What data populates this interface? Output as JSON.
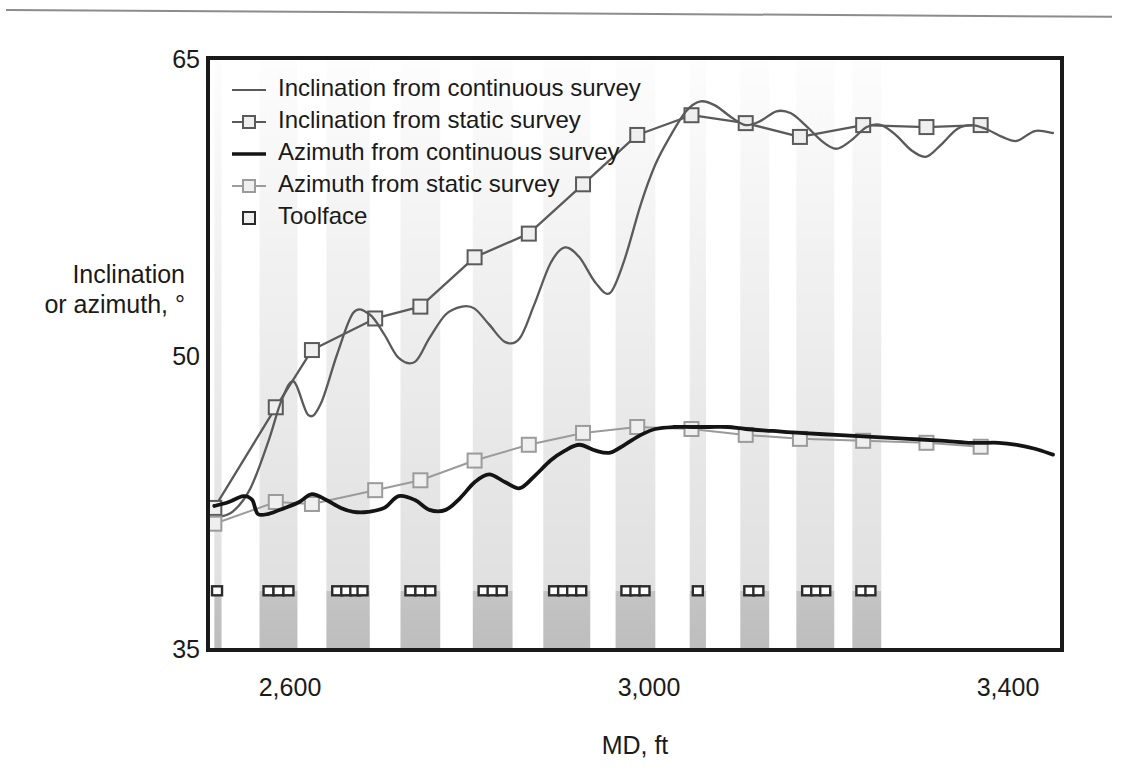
{
  "figure": {
    "background": "#ffffff",
    "plot_frame_color": "#1a1a1a",
    "top_rule_color": "#8c8c8c"
  },
  "chart_data": {
    "type": "line",
    "title": "",
    "subtitle": "",
    "xlabel": "MD, ft",
    "ylabel": "Inclination or azimuth, °",
    "ylabel_line1": "Inclination",
    "ylabel_line2": "or azimuth, °",
    "xlim": [
      2505,
      3450
    ],
    "ylim": [
      35,
      65
    ],
    "xticks": [
      2600,
      3000,
      3400
    ],
    "xtick_labels": [
      "2,600",
      "3,000",
      "3,400"
    ],
    "yticks": [
      35,
      50,
      65
    ],
    "ytick_labels": [
      "35",
      "50",
      "65"
    ],
    "grid": false,
    "legend_position": "top-left",
    "legend": [
      {
        "label": "Inclination from continuous survey",
        "marker": "line",
        "color": "#5a5a5a",
        "width": 2.2
      },
      {
        "label": "Inclination from static survey",
        "marker": "line-square",
        "color": "#5a5a5a",
        "width": 2.2
      },
      {
        "label": "Azimuth from continuous survey",
        "marker": "line",
        "color": "#141414",
        "width": 3.6
      },
      {
        "label": "Azimuth from static survey",
        "marker": "line-square",
        "color": "#9b9b9b",
        "width": 2.0
      },
      {
        "label": "Toolface",
        "marker": "square",
        "color": "#2b2b2b",
        "width": 0
      }
    ],
    "series": [
      {
        "name": "Inclination from static survey",
        "type": "line-marker",
        "color": "#5a5a5a",
        "marker": "square-open",
        "x": [
          2512,
          2580,
          2620,
          2690,
          2740,
          2800,
          2860,
          2920,
          2980,
          3040,
          3100,
          3160,
          3230,
          3300,
          3360
        ],
        "y": [
          42.2,
          47.3,
          50.2,
          51.8,
          52.4,
          54.9,
          56.1,
          58.6,
          61.1,
          62.1,
          61.7,
          61.0,
          61.6,
          61.5,
          61.6
        ]
      },
      {
        "name": "Inclination from continuous survey",
        "type": "line",
        "color": "#5a5a5a",
        "x": [
          2512,
          2532,
          2552,
          2572,
          2586,
          2600,
          2616,
          2630,
          2648,
          2666,
          2684,
          2700,
          2716,
          2734,
          2750,
          2768,
          2786,
          2800,
          2816,
          2834,
          2850,
          2866,
          2884,
          2900,
          2916,
          2934,
          2950,
          2966,
          2984,
          3000,
          3016,
          3034,
          3050,
          3066,
          3084,
          3100,
          3116,
          3134,
          3150,
          3166,
          3184,
          3200,
          3216,
          3234,
          3250,
          3266,
          3284,
          3300,
          3316,
          3334,
          3350,
          3366,
          3384,
          3400,
          3420,
          3440
        ],
        "y": [
          41.7,
          42.0,
          43.2,
          45.6,
          47.6,
          48.6,
          46.9,
          47.5,
          50.0,
          52.1,
          52.0,
          51.0,
          49.8,
          49.6,
          50.8,
          52.0,
          52.4,
          52.3,
          51.5,
          50.6,
          50.8,
          52.5,
          54.6,
          55.4,
          54.9,
          53.6,
          53.1,
          54.8,
          57.6,
          59.6,
          61.0,
          62.3,
          62.8,
          62.6,
          62.0,
          61.6,
          61.8,
          62.3,
          62.2,
          61.6,
          60.8,
          60.4,
          60.8,
          61.5,
          61.6,
          61.1,
          60.3,
          60.0,
          60.6,
          61.4,
          61.6,
          61.4,
          61.0,
          60.8,
          61.3,
          61.2
        ]
      },
      {
        "name": "Azimuth from static survey",
        "type": "line-marker",
        "color": "#9b9b9b",
        "marker": "square-open",
        "x": [
          2512,
          2580,
          2620,
          2690,
          2740,
          2800,
          2860,
          2920,
          2980,
          3040,
          3100,
          3160,
          3230,
          3300,
          3360
        ],
        "y": [
          41.4,
          42.5,
          42.4,
          43.1,
          43.6,
          44.6,
          45.4,
          46.0,
          46.3,
          46.2,
          45.9,
          45.7,
          45.6,
          45.5,
          45.3
        ]
      },
      {
        "name": "Azimuth from continuous survey",
        "type": "line",
        "color": "#141414",
        "x": [
          2512,
          2528,
          2544,
          2554,
          2560,
          2572,
          2590,
          2606,
          2620,
          2636,
          2652,
          2666,
          2682,
          2700,
          2716,
          2734,
          2750,
          2768,
          2784,
          2800,
          2816,
          2834,
          2850,
          2866,
          2884,
          2900,
          2916,
          2934,
          2950,
          2966,
          2984,
          3000,
          3020,
          3040,
          3060,
          3080,
          3100,
          3130,
          3160,
          3200,
          3240,
          3280,
          3320,
          3350,
          3380,
          3400,
          3420,
          3440
        ],
        "y": [
          42.3,
          42.5,
          42.8,
          42.6,
          41.9,
          41.9,
          42.2,
          42.5,
          42.9,
          42.6,
          42.2,
          42.0,
          42.0,
          42.2,
          42.8,
          42.6,
          42.1,
          42.1,
          42.7,
          43.5,
          43.9,
          43.5,
          43.2,
          43.8,
          44.6,
          45.1,
          45.4,
          45.1,
          45.0,
          45.4,
          45.9,
          46.2,
          46.3,
          46.3,
          46.3,
          46.3,
          46.2,
          46.1,
          46.0,
          45.9,
          45.8,
          45.7,
          45.6,
          45.5,
          45.5,
          45.4,
          45.2,
          44.9
        ]
      }
    ],
    "toolface_markers": {
      "name": "Toolface",
      "color": "#2b2b2b",
      "marker": "square-open",
      "y": 38.0,
      "x": [
        2515,
        2572,
        2583,
        2594,
        2648,
        2658,
        2668,
        2676,
        2729,
        2740,
        2751,
        2810,
        2820,
        2830,
        2888,
        2898,
        2908,
        2918,
        2968,
        2978,
        2988,
        3047,
        3104,
        3114,
        3168,
        3178,
        3188,
        3228,
        3238
      ]
    },
    "shaded_bands": {
      "description": "vertical gradient bands (slide/rotate intervals)",
      "top_color": "#fbfbfb",
      "mid_color": "#e3e3e3",
      "bottom_color": "#bcbcbc",
      "split_value": 38.0,
      "intervals": [
        [
          2562,
          2604
        ],
        [
          2636,
          2684
        ],
        [
          2718,
          2762
        ],
        [
          2798,
          2842
        ],
        [
          2876,
          2928
        ],
        [
          2956,
          3000
        ],
        [
          3038,
          3056
        ],
        [
          3094,
          3126
        ],
        [
          3156,
          3198
        ],
        [
          3218,
          3250
        ],
        [
          2512,
          2520
        ]
      ]
    }
  }
}
